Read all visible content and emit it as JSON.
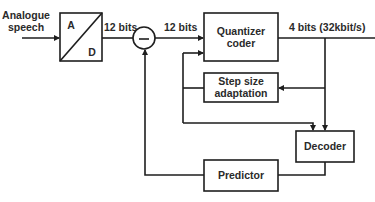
{
  "diagram": {
    "type": "block-diagram",
    "input": {
      "label_line1": "Analogue",
      "label_line2": "speech"
    },
    "blocks": {
      "adc": {
        "top_label": "A",
        "bottom_label": "D"
      },
      "subtractor": {
        "symbol": "−"
      },
      "quantizer": {
        "line1": "Quantizer",
        "line2": "coder"
      },
      "step_size": {
        "line1": "Step size",
        "line2": "adaptation"
      },
      "decoder": {
        "label": "Decoder"
      },
      "predictor": {
        "label": "Predictor"
      }
    },
    "signals": {
      "adc_out": "12 bits",
      "diff_out": "12 bits",
      "output": "4 bits (32kbit/s)"
    },
    "colors": {
      "line": "#1e1e1e",
      "text": "#2a2a2a",
      "background": "#ffffff"
    }
  }
}
